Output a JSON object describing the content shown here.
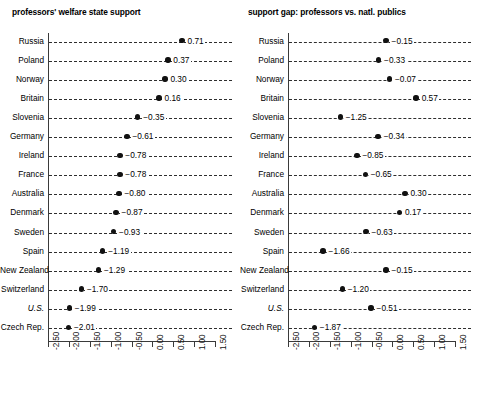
{
  "figure": {
    "panels": [
      {
        "title": "professors' welfare state support",
        "axis": {
          "min": -2.5,
          "max": 1.5,
          "ticks": [
            "-2.50",
            "-2.00",
            "-1.50",
            "-1.00",
            "-0.50",
            "0.00",
            "0.50",
            "1.00",
            "1.50"
          ],
          "tick_values": [
            -2.5,
            -2.0,
            -1.5,
            -1.0,
            -0.5,
            0.0,
            0.5,
            1.0,
            1.5
          ]
        },
        "rows": [
          {
            "label": "Russia",
            "value": 0.71,
            "display": "0.71"
          },
          {
            "label": "Poland",
            "value": 0.37,
            "display": "0.37"
          },
          {
            "label": "Norway",
            "value": 0.3,
            "display": "0.30"
          },
          {
            "label": "Britain",
            "value": 0.16,
            "display": "0.16"
          },
          {
            "label": "Slovenia",
            "value": -0.35,
            "display": "−0.35"
          },
          {
            "label": "Germany",
            "value": -0.61,
            "display": "−0.61"
          },
          {
            "label": "Ireland",
            "value": -0.78,
            "display": "−0.78"
          },
          {
            "label": "France",
            "value": -0.78,
            "display": "−0.78"
          },
          {
            "label": "Australia",
            "value": -0.8,
            "display": "−0.80"
          },
          {
            "label": "Denmark",
            "value": -0.87,
            "display": "−0.87"
          },
          {
            "label": "Sweden",
            "value": -0.93,
            "display": "−0.93"
          },
          {
            "label": "Spain",
            "value": -1.19,
            "display": "−1.19"
          },
          {
            "label": "New Zealand",
            "value": -1.29,
            "display": "−1.29"
          },
          {
            "label": "Switzerland",
            "value": -1.7,
            "display": "−1.70"
          },
          {
            "label": "U.S.",
            "value": -1.99,
            "display": "−1.99",
            "italic": true
          },
          {
            "label": "Czech Rep.",
            "value": -2.01,
            "display": "−2.01"
          }
        ]
      },
      {
        "title": "support gap: professors vs. natl. publics",
        "axis": {
          "min": -2.5,
          "max": 1.5,
          "ticks": [
            "-2.50",
            "-2.00",
            "-1.50",
            "-1.00",
            "-0.50",
            "0.00",
            "0.50",
            "1.00",
            "1.50"
          ],
          "tick_values": [
            -2.5,
            -2.0,
            -1.5,
            -1.0,
            -0.5,
            0.0,
            0.5,
            1.0,
            1.5
          ]
        },
        "rows": [
          {
            "label": "Russia",
            "value": -0.15,
            "display": "−0.15"
          },
          {
            "label": "Poland",
            "value": -0.33,
            "display": "−0.33"
          },
          {
            "label": "Norway",
            "value": -0.07,
            "display": "−0.07"
          },
          {
            "label": "Britain",
            "value": 0.57,
            "display": "0.57"
          },
          {
            "label": "Slovenia",
            "value": -1.25,
            "display": "−1.25"
          },
          {
            "label": "Germany",
            "value": -0.34,
            "display": "−0.34"
          },
          {
            "label": "Ireland",
            "value": -0.85,
            "display": "−0.85"
          },
          {
            "label": "France",
            "value": -0.65,
            "display": "−0.65"
          },
          {
            "label": "Australia",
            "value": 0.3,
            "display": "0.30"
          },
          {
            "label": "Denmark",
            "value": 0.17,
            "display": "0.17"
          },
          {
            "label": "Sweden",
            "value": -0.63,
            "display": "−0.63"
          },
          {
            "label": "Spain",
            "value": -1.66,
            "display": "−1.66"
          },
          {
            "label": "New Zealand",
            "value": -0.15,
            "display": "−0.15"
          },
          {
            "label": "Switzerland",
            "value": -1.2,
            "display": "−1.20"
          },
          {
            "label": "U.S.",
            "value": -0.51,
            "display": "−0.51",
            "italic": true
          },
          {
            "label": "Czech Rep.",
            "value": -1.87,
            "display": "−1.87"
          }
        ]
      }
    ]
  },
  "chart_data": [
    {
      "type": "scatter",
      "title": "professors' welfare state support",
      "xlabel": "",
      "ylabel": "",
      "xlim": [
        -2.5,
        1.5
      ],
      "xticks": [
        -2.5,
        -2.0,
        -1.5,
        -1.0,
        -0.5,
        0.0,
        0.5,
        1.0,
        1.5
      ],
      "xticklabels": [
        "-2.50",
        "-2.00",
        "-1.50",
        "-1.00",
        "-0.50",
        "0.00",
        "0.50",
        "1.00",
        "1.50"
      ],
      "grid": false,
      "legend": "none",
      "categories": [
        "Russia",
        "Poland",
        "Norway",
        "Britain",
        "Slovenia",
        "Germany",
        "Ireland",
        "France",
        "Australia",
        "Denmark",
        "Sweden",
        "Spain",
        "New Zealand",
        "Switzerland",
        "U.S.",
        "Czech Rep."
      ],
      "values": [
        0.71,
        0.37,
        0.3,
        0.16,
        -0.35,
        -0.61,
        -0.78,
        -0.78,
        -0.8,
        -0.87,
        -0.93,
        -1.19,
        -1.29,
        -1.7,
        -1.99,
        -2.01
      ]
    },
    {
      "type": "scatter",
      "title": "support gap: professors vs. natl. publics",
      "xlabel": "",
      "ylabel": "",
      "xlim": [
        -2.5,
        1.5
      ],
      "xticks": [
        -2.5,
        -2.0,
        -1.5,
        -1.0,
        -0.5,
        0.0,
        0.5,
        1.0,
        1.5
      ],
      "xticklabels": [
        "-2.50",
        "-2.00",
        "-1.50",
        "-1.00",
        "-0.50",
        "0.00",
        "0.50",
        "1.00",
        "1.50"
      ],
      "grid": false,
      "legend": "none",
      "categories": [
        "Russia",
        "Poland",
        "Norway",
        "Britain",
        "Slovenia",
        "Germany",
        "Ireland",
        "France",
        "Australia",
        "Denmark",
        "Sweden",
        "Spain",
        "New Zealand",
        "Switzerland",
        "U.S.",
        "Czech Rep."
      ],
      "values": [
        -0.15,
        -0.33,
        -0.07,
        0.57,
        -1.25,
        -0.34,
        -0.85,
        -0.65,
        0.3,
        0.17,
        -0.63,
        -1.66,
        -0.15,
        -1.87
      ]
    }
  ]
}
